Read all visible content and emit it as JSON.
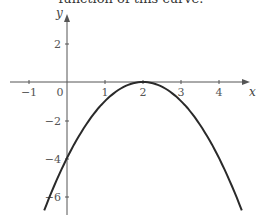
{
  "caption": "function of this curve.",
  "chart_data": {
    "type": "line",
    "title": "",
    "xlabel": "x",
    "ylabel": "y",
    "x_ticks": [
      -1,
      0,
      1,
      2,
      3,
      4
    ],
    "y_ticks": [
      2,
      -2,
      -4,
      -6
    ],
    "xlim": [
      -1.5,
      4.8
    ],
    "ylim": [
      -7,
      3.5
    ],
    "grid": false,
    "series": [
      {
        "name": "y = -(x - 2)^2",
        "x": [
          -0.6,
          0,
          0.5,
          1,
          1.5,
          2,
          2.5,
          3,
          3.5,
          4,
          4.6
        ],
        "y": [
          -6.76,
          -4,
          -2.25,
          -1,
          -0.25,
          0,
          -0.25,
          -1,
          -2.25,
          -4,
          -6.76
        ]
      }
    ],
    "annotations": [
      "vertex at (2, 0)",
      "y-intercept at (0, -4)"
    ]
  },
  "labels": {
    "x_axis": "x",
    "y_axis": "y",
    "xt_m1": "−1",
    "xt_0": "0",
    "xt_1": "1",
    "xt_2": "2",
    "xt_3": "3",
    "xt_4": "4",
    "yt_2": "2",
    "yt_m2": "−2",
    "yt_m4": "−4",
    "yt_m6": "−6"
  },
  "colors": {
    "axis": "#555555",
    "curve": "#2a2a2a"
  }
}
